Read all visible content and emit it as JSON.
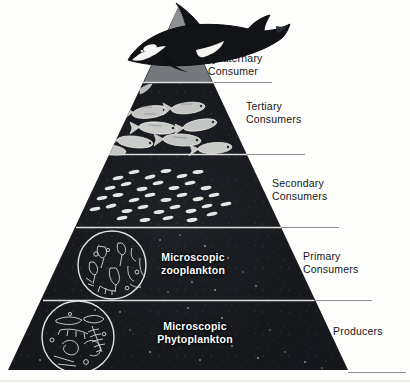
{
  "diagram": {
    "type": "trophic-pyramid",
    "background_color": "#fdfdfb",
    "pyramid_color": "#16181c",
    "apex_color": "#8d8f93",
    "divider_color": "#dcdcda",
    "label_color": "#141720",
    "inner_label_color": "#ffffff"
  },
  "levels": [
    {
      "id": "quaternary",
      "label": "Quaternary\nConsumer",
      "organism_icon": "orca-icon",
      "inner_label": ""
    },
    {
      "id": "tertiary",
      "label": "Tertiary\nConsumers",
      "organism_icon": "fish-school-large-icon",
      "inner_label": ""
    },
    {
      "id": "secondary",
      "label": "Secondary\nConsumers",
      "organism_icon": "fish-school-small-icon",
      "inner_label": ""
    },
    {
      "id": "primary",
      "label": "Primary\nConsumers",
      "organism_icon": "zooplankton-circle-icon",
      "inner_label": "Microscopic\nzooplankton"
    },
    {
      "id": "producers",
      "label": "Producers",
      "organism_icon": "phytoplankton-circle-icon",
      "inner_label": "Microscopic\nPhytoplankton"
    }
  ]
}
